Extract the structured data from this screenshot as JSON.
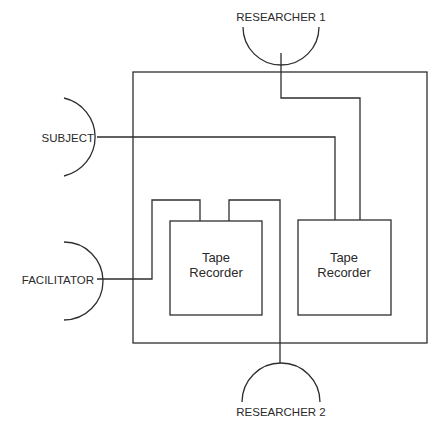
{
  "diagram": {
    "type": "audio recording setup",
    "participants": [
      {
        "id": "researcher1",
        "label": "RESEARCHER 1",
        "position": "top"
      },
      {
        "id": "subject",
        "label": "SUBJECT",
        "position": "left-upper"
      },
      {
        "id": "facilitator",
        "label": "FACILITATOR",
        "position": "left-lower"
      },
      {
        "id": "researcher2",
        "label": "RESEARCHER 2",
        "position": "bottom"
      }
    ],
    "recorders": [
      {
        "id": "recorder_left",
        "line1": "Tape",
        "line2": "Recorder"
      },
      {
        "id": "recorder_right",
        "line1": "Tape",
        "line2": "Recorder"
      }
    ],
    "connections": [
      {
        "from": "facilitator",
        "to": "recorder_left"
      },
      {
        "from": "researcher2",
        "to": "recorder_left"
      },
      {
        "from": "subject",
        "to": "recorder_right"
      },
      {
        "from": "researcher1",
        "to": "recorder_right"
      }
    ],
    "colors": {
      "stroke": "#2e2e2e",
      "text": "#2a2a2a",
      "background": "#ffffff"
    }
  }
}
